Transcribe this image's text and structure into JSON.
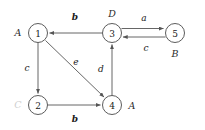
{
  "figure": {
    "kind": "directed-graph",
    "width": 205,
    "height": 130,
    "background": "#ffffff",
    "edge_color": "#555555",
    "node_stroke": "#4a4a4a",
    "text_color": "#1a1a1a",
    "faint_text_color": "#cfcfcf"
  },
  "nodes": [
    {
      "id": "1",
      "label": "1",
      "tag": "A",
      "tag_position": "left",
      "faint": false,
      "cx": 38,
      "cy": 33,
      "r": 9.5
    },
    {
      "id": "2",
      "label": "2",
      "tag": "C",
      "tag_position": "left",
      "faint": true,
      "cx": 38,
      "cy": 105,
      "r": 9.5
    },
    {
      "id": "3",
      "label": "3",
      "tag": "D",
      "tag_position": "above",
      "faint": false,
      "cx": 112,
      "cy": 33,
      "r": 9.5
    },
    {
      "id": "4",
      "label": "4",
      "tag": "A",
      "tag_position": "right",
      "faint": false,
      "cx": 112,
      "cy": 105,
      "r": 9.5
    },
    {
      "id": "5",
      "label": "5",
      "tag": "B",
      "tag_position": "below",
      "faint": false,
      "cx": 175,
      "cy": 33,
      "r": 9.5
    }
  ],
  "edges": [
    {
      "from": "3",
      "to": "1",
      "label": "b",
      "bold": true,
      "label_x": 75,
      "label_y": 17
    },
    {
      "from": "3",
      "to": "5",
      "label": "a",
      "bold": false,
      "label_x": 144,
      "label_y": 18
    },
    {
      "from": "5",
      "to": "3",
      "label": "c",
      "bold": false,
      "label_x": 146,
      "label_y": 48
    },
    {
      "from": "1",
      "to": "2",
      "label": "c",
      "bold": false,
      "label_x": 27,
      "label_y": 68
    },
    {
      "from": "1",
      "to": "4",
      "label": "e",
      "bold": false,
      "label_x": 76,
      "label_y": 62
    },
    {
      "from": "4",
      "to": "3",
      "label": "d",
      "bold": false,
      "label_x": 101,
      "label_y": 69
    },
    {
      "from": "2",
      "to": "4",
      "label": "b",
      "bold": true,
      "label_x": 75,
      "label_y": 119
    }
  ]
}
